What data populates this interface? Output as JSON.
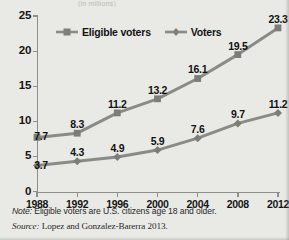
{
  "figure": {
    "title_sliver": "(in millions)",
    "note": {
      "lead": "Note:",
      "body": " Eligible voters are U.S. citizens age 18 and older."
    },
    "source": {
      "lead": "Source:",
      "body": " Lopez and Gonzalez-Barerra 2013."
    }
  },
  "colors": {
    "eligible_voters": "#8a8a87",
    "voters": "#8a8a87",
    "axis": "#8e8e8b",
    "background": "#e9e9e6",
    "text": "#151515"
  },
  "chart_data": {
    "type": "line",
    "title": "",
    "xlabel": "",
    "ylabel": "",
    "categories": [
      "1988",
      "1992",
      "1996",
      "2000",
      "2004",
      "2008",
      "2012"
    ],
    "x": [
      1988,
      1992,
      1996,
      2000,
      2004,
      2008,
      2012
    ],
    "ylim": [
      0,
      25
    ],
    "yticks": [
      0,
      5,
      10,
      15,
      20,
      25
    ],
    "grid": false,
    "legend_position": "top-center",
    "series": [
      {
        "name": "Eligible voters",
        "marker": "square",
        "values": [
          7.7,
          8.3,
          11.2,
          13.2,
          16.1,
          19.5,
          23.3
        ],
        "labels": [
          "7.7",
          "8.3",
          "11.2",
          "13.2",
          "16.1",
          "19.5",
          "23.3"
        ]
      },
      {
        "name": "Voters",
        "marker": "diamond",
        "values": [
          3.7,
          4.3,
          4.9,
          5.9,
          7.6,
          9.7,
          11.2
        ],
        "labels": [
          "3.7",
          "4.3",
          "4.9",
          "5.9",
          "7.6",
          "9.7",
          "11.2"
        ]
      }
    ]
  }
}
